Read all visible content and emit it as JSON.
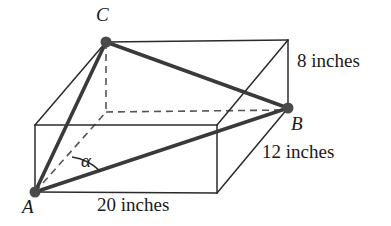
{
  "figure": {
    "kind": "geometry-diagram",
    "stroke_color": "#2b2b2b",
    "bold_stroke_color": "#3a3a3a",
    "dash_color": "#555555",
    "vertex_dot_color": "#4a4a4a",
    "background": "#ffffff"
  },
  "vertices": [
    {
      "id": "C",
      "label": "C",
      "x": 106,
      "y": 42,
      "label_x": 96,
      "label_y": 6,
      "dot": true
    },
    {
      "id": "B",
      "label": "B",
      "x": 288,
      "y": 108,
      "label_x": 291,
      "label_y": 115,
      "dot": true
    },
    {
      "id": "A",
      "label": "A",
      "x": 35,
      "y": 192,
      "label_x": 22,
      "label_y": 198,
      "dot": true
    }
  ],
  "angles": [
    {
      "id": "alpha",
      "label": "α",
      "at_vertex": "A",
      "label_x": 81,
      "label_y": 152
    }
  ],
  "dimensions": [
    {
      "id": "height",
      "label": "8 inches",
      "value": 8,
      "unit": "inches",
      "edge": "vertical-right",
      "x": 297,
      "y": 52
    },
    {
      "id": "depth",
      "label": "12 inches",
      "value": 12,
      "unit": "inches",
      "edge": "diagonal-right",
      "x": 262,
      "y": 143
    },
    {
      "id": "width",
      "label": "20 inches",
      "value": 20,
      "unit": "inches",
      "edge": "bottom-front",
      "x": 97,
      "y": 196
    }
  ],
  "solid_edges": [
    {
      "name": "front-top-edge",
      "x1": 35,
      "y1": 125,
      "x2": 217,
      "y2": 125
    },
    {
      "name": "front-left-vertical",
      "x1": 35,
      "y1": 125,
      "x2": 35,
      "y2": 192
    },
    {
      "name": "front-right-vertical",
      "x1": 217,
      "y1": 125,
      "x2": 217,
      "y2": 193
    },
    {
      "name": "front-bottom-edge",
      "x1": 35,
      "y1": 192,
      "x2": 217,
      "y2": 193
    },
    {
      "name": "top-left-slant",
      "x1": 35,
      "y1": 125,
      "x2": 106,
      "y2": 42
    },
    {
      "name": "top-back-edge",
      "x1": 106,
      "y1": 42,
      "x2": 288,
      "y2": 40
    },
    {
      "name": "top-right-slant",
      "x1": 217,
      "y1": 125,
      "x2": 288,
      "y2": 40
    },
    {
      "name": "back-right-vertical",
      "x1": 288,
      "y1": 40,
      "x2": 288,
      "y2": 108
    },
    {
      "name": "bottom-right-slant",
      "x1": 217,
      "y1": 193,
      "x2": 288,
      "y2": 108
    }
  ],
  "dashed_edges": [
    {
      "name": "hidden-back-left-vertical",
      "x1": 106,
      "y1": 42,
      "x2": 106,
      "y2": 112
    },
    {
      "name": "hidden-bottom-back-edge",
      "x1": 106,
      "y1": 112,
      "x2": 288,
      "y2": 110
    },
    {
      "name": "hidden-bottom-left-slant",
      "x1": 35,
      "y1": 192,
      "x2": 106,
      "y2": 112
    }
  ],
  "bold_edges": [
    {
      "name": "diagonal-A-to-C",
      "from": "A",
      "to": "C",
      "x1": 35,
      "y1": 192,
      "x2": 106,
      "y2": 42
    },
    {
      "name": "diagonal-A-to-B",
      "from": "A",
      "to": "B",
      "x1": 35,
      "y1": 192,
      "x2": 288,
      "y2": 108
    },
    {
      "name": "diagonal-C-to-B",
      "from": "C",
      "to": "B",
      "x1": 106,
      "y1": 42,
      "x2": 288,
      "y2": 108
    }
  ],
  "angle_arc": {
    "name": "alpha-arc",
    "path": "M 71 158 A 48 48 0 0 1 99 170",
    "center_x": 35,
    "center_y": 192
  }
}
